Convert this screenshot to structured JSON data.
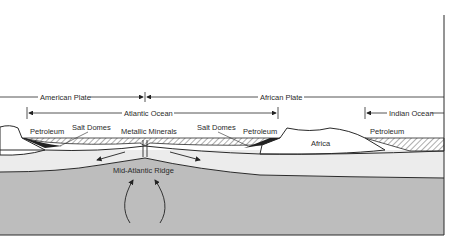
{
  "diagram": {
    "plates": {
      "american": "American Plate",
      "african": "African Plate"
    },
    "oceans": {
      "atlantic": "Atlantic Ocean",
      "indian": "Indian Ocean"
    },
    "labels": {
      "petroleum_left": "Petroleum",
      "salt_domes_left": "Salt Domes",
      "metallic_minerals": "Metallic Minerals",
      "salt_domes_right": "Salt Domes",
      "petroleum_mid": "Petroleum",
      "africa": "Africa",
      "petroleum_right": "Petroleum",
      "ridge": "Mid-Atlantic Ridge"
    },
    "colors": {
      "mantle": "#bdbdbd",
      "crust": "#ececec",
      "continent": "#ffffff",
      "line": "#2a2a2a"
    }
  }
}
